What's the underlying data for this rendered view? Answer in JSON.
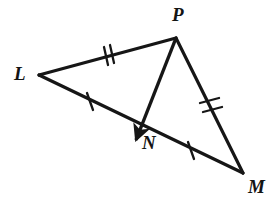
{
  "figure": {
    "kind": "geometry-diagram",
    "background_color": "#ffffff",
    "stroke_color": "#161616",
    "stroke_width": 3,
    "canvas": {
      "width": 272,
      "height": 215
    },
    "points": [
      {
        "id": "L",
        "label": "L",
        "x": 39,
        "y": 75,
        "label_x": 14,
        "label_y": 64
      },
      {
        "id": "P",
        "label": "P",
        "x": 176,
        "y": 38,
        "label_x": 172,
        "label_y": 5
      },
      {
        "id": "M",
        "label": "M",
        "x": 243,
        "y": 173,
        "label_x": 248,
        "label_y": 177
      },
      {
        "id": "N",
        "label": "N",
        "x": 140,
        "y": 128,
        "label_x": 142,
        "label_y": 133
      }
    ],
    "segments": [
      {
        "id": "LP",
        "from": "L",
        "to": "P",
        "x1": 39,
        "y1": 75,
        "x2": 176,
        "y2": 38,
        "ticks": 2,
        "tick_x": 108,
        "tick_y": 56
      },
      {
        "id": "LM",
        "from": "L",
        "to": "M",
        "x1": 39,
        "y1": 75,
        "x2": 243,
        "y2": 173,
        "ticks": 0,
        "tick_x": 0,
        "tick_y": 0
      },
      {
        "id": "PM",
        "from": "P",
        "to": "M",
        "x1": 176,
        "y1": 38,
        "x2": 243,
        "y2": 173,
        "ticks": 2,
        "tick_x": 210,
        "tick_y": 106
      },
      {
        "id": "LN",
        "from": "L",
        "to": "N",
        "x1": 39,
        "y1": 75,
        "x2": 140,
        "y2": 128,
        "ticks": 1,
        "tick_x": 90,
        "tick_y": 101
      },
      {
        "id": "NM",
        "from": "N",
        "to": "M",
        "x1": 140,
        "y1": 128,
        "x2": 243,
        "y2": 173,
        "ticks": 1,
        "tick_x": 191,
        "tick_y": 150
      }
    ],
    "ray": {
      "id": "PN",
      "from": "P",
      "through": "N",
      "x1": 176,
      "y1": 38,
      "x2": 133,
      "y2": 148,
      "arrowhead": true,
      "arrow_tip_x": 131,
      "arrow_tip_y": 151
    },
    "congruence_marks": [
      {
        "segment": "LP",
        "count": 2
      },
      {
        "segment": "PM",
        "count": 2
      },
      {
        "segment": "LN",
        "count": 1
      },
      {
        "segment": "NM",
        "count": 1
      }
    ]
  }
}
